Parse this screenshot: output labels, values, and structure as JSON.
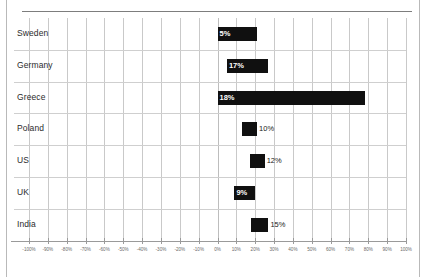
{
  "chart_data": {
    "type": "bar",
    "orientation": "horizontal",
    "title": "",
    "xlabel": "",
    "ylabel": "",
    "xlim": [
      -100,
      100
    ],
    "grid": true,
    "legend": false,
    "categories": [
      "Sweden",
      "Germany",
      "Greece",
      "Poland",
      "US",
      "UK",
      "India"
    ],
    "value_labels": [
      "5%",
      "17%",
      "18%",
      "10%",
      "12%",
      "9%",
      "15%"
    ],
    "values": [
      5,
      17,
      18,
      10,
      12,
      9,
      15
    ],
    "bar_spans": [
      {
        "category": "Sweden",
        "start": 0,
        "end": 21,
        "label": "5%",
        "label_position": "inside"
      },
      {
        "category": "Germany",
        "start": 5,
        "end": 27,
        "label": "17%",
        "label_position": "inside"
      },
      {
        "category": "Greece",
        "start": 0,
        "end": 78,
        "label": "18%",
        "label_position": "inside"
      },
      {
        "category": "Poland",
        "start": 13,
        "end": 21,
        "label": "10%",
        "label_position": "outside"
      },
      {
        "category": "US",
        "start": 17,
        "end": 25,
        "label": "12%",
        "label_position": "outside"
      },
      {
        "category": "UK",
        "start": 9,
        "end": 20,
        "label": "9%",
        "label_position": "inside"
      },
      {
        "category": "India",
        "start": 18,
        "end": 27,
        "label": "15%",
        "label_position": "outside"
      }
    ],
    "xticks": [
      -100,
      -90,
      -80,
      -70,
      -60,
      -50,
      -40,
      -30,
      -20,
      -10,
      0,
      10,
      20,
      30,
      40,
      50,
      60,
      70,
      80,
      90,
      100
    ],
    "xticklabels": [
      "-100%",
      "-90%",
      "-80%",
      "-70%",
      "-60%",
      "-50%",
      "-40%",
      "-30%",
      "-20%",
      "-10%",
      "0%",
      "10%",
      "20%",
      "30%",
      "40%",
      "50%",
      "60%",
      "70%",
      "80%",
      "90%",
      "100%"
    ],
    "bar_color": "#101010",
    "grid_color": "#c9c9c9",
    "axis_color": "#9a9a9a"
  }
}
